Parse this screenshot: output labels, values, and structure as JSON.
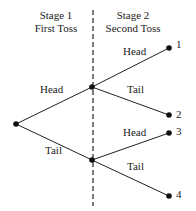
{
  "diagram": {
    "title_stage1": "Stage 1",
    "subtitle_stage1": "First Toss",
    "title_stage2": "Stage 2",
    "subtitle_stage2": "Second Toss",
    "branches": {
      "first_head": "Head",
      "first_tail": "Tail",
      "upper_head": "Head",
      "upper_tail": "Tail",
      "lower_head": "Head",
      "lower_tail": "Tail"
    },
    "outcomes": [
      "1",
      "2",
      "3",
      "4"
    ],
    "colors": {
      "line": "#222222",
      "node": "#111111",
      "background": "#ffffff"
    }
  }
}
